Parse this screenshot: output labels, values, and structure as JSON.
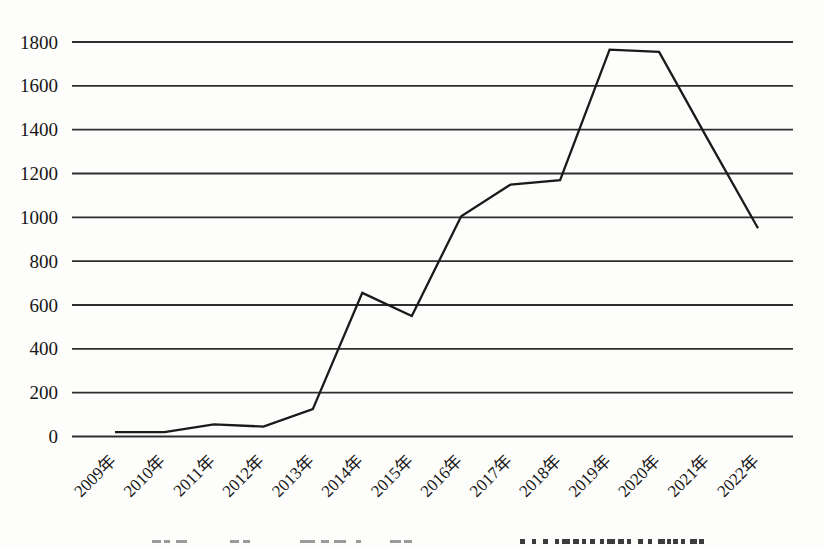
{
  "chart_data": {
    "type": "line",
    "title": "",
    "xlabel": "",
    "ylabel": "",
    "categories": [
      "2009年",
      "2010年",
      "2011年",
      "2012年",
      "2013年",
      "2014年",
      "2015年",
      "2016年",
      "2017年",
      "2018年",
      "2019年",
      "2020年",
      "2021年",
      "2022年"
    ],
    "series": [
      {
        "name": "annual-count",
        "values": [
          20,
          20,
          55,
          45,
          125,
          655,
          550,
          1005,
          1150,
          1170,
          1765,
          1755,
          1350,
          950
        ]
      }
    ],
    "ylim": [
      0,
      1800
    ],
    "yticks": [
      0,
      200,
      400,
      600,
      800,
      1000,
      1200,
      1400,
      1600,
      1800
    ],
    "grid": "horizontal-only",
    "legend": "none",
    "x_label_rotation_deg": -45,
    "colors": {
      "line": "#1a1a1a",
      "gridline": "#2e2e2e",
      "tick_text": "#151515",
      "background": "#fdfdfc"
    }
  }
}
